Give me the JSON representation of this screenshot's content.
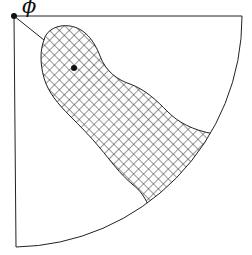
{
  "diagram": {
    "type": "sector-with-hatched-region",
    "labels": {
      "angle": "ϕ"
    },
    "elements": {
      "origin_point": "filled-dot",
      "center_point": "filled-dot",
      "boundary": "quarter-circle-sector",
      "region": "crosshatched-blob"
    },
    "colors": {
      "stroke": "#222222",
      "hatch": "#333333",
      "background": "#ffffff"
    }
  }
}
